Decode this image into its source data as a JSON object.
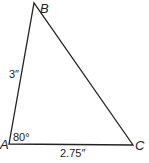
{
  "diagram": {
    "type": "triangle",
    "vertices": {
      "A": {
        "label": "A",
        "x": 9,
        "y": 144
      },
      "B": {
        "label": "B",
        "x": 34,
        "y": 3
      },
      "C": {
        "label": "C",
        "x": 133,
        "y": 145
      }
    },
    "side_AB": {
      "label": "3″"
    },
    "side_AC": {
      "label": "2.75″"
    },
    "angle_A": {
      "label": "80°"
    },
    "stroke_color": "#222222"
  }
}
